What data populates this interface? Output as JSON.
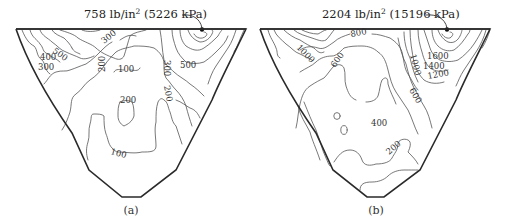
{
  "figure": {
    "type": "contour-diagram",
    "panels": [
      {
        "id": "a",
        "caption": "(a)",
        "peak_annotation": {
          "value_imperial": "758",
          "unit_imperial_base": "lb/in",
          "unit_imperial_exp": "2",
          "value_si": "(5226 kPa)"
        },
        "contour_labels": [
          "300",
          "500",
          "400",
          "300",
          "200",
          "100",
          "300",
          "500",
          "200",
          "200",
          "100"
        ]
      },
      {
        "id": "b",
        "caption": "(b)",
        "peak_annotation": {
          "value_imperial": "2204",
          "unit_imperial_base": "lb/in",
          "unit_imperial_exp": "2",
          "value_si": "(15196 kPa)"
        },
        "contour_labels": [
          "800",
          "1000",
          "600",
          "1000",
          "1600",
          "1400",
          "1200",
          "600",
          "400",
          "200"
        ]
      }
    ]
  },
  "colors": {
    "outline": "#2a2a2a",
    "contour": "#555555",
    "background": "#ffffff"
  }
}
